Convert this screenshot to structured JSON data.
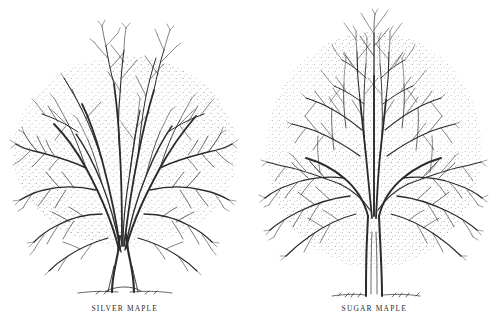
{
  "plate": {
    "background_color": "#ffffff",
    "ink_color": "#2b2b2b",
    "stipple_color": "#9a9a9a",
    "width": 499,
    "height": 328,
    "medium": "pen-and-ink botanical line drawing",
    "subject": "winter silhouettes of two bare deciduous maple trees"
  },
  "panels": [
    {
      "id": "silver-maple",
      "caption": "SILVER MAPLE",
      "habit": "broad vase-shaped crown, multiple ascending trunks, wider than tall",
      "trunk": "short buttressed trunk dividing low into many upright stems",
      "crown_width_px": 220,
      "crown_height_px": 250,
      "ground_line": true
    },
    {
      "id": "sugar-maple",
      "caption": "SUGAR MAPLE",
      "habit": "upright oval to rounded crown with dominant central leader",
      "trunk": "single straight trunk forking high into spreading limbs",
      "crown_width_px": 225,
      "crown_height_px": 270,
      "ground_line": true
    }
  ]
}
